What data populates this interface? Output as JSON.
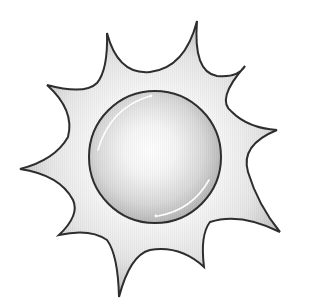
{
  "image": {
    "subject": "sun-illustration",
    "style": "grayscale clip art",
    "colors": {
      "background": "#ffffff",
      "outline": "#2e2e2e",
      "ray_fill_light": "#f7f7f7",
      "ray_fill_dark": "#cfcfcf",
      "disc_center": "#ffffff",
      "disc_edge": "#bdbdbd",
      "highlight": "#ffffff"
    },
    "sun": {
      "ray_count": 10,
      "disc": {
        "cx": 155,
        "cy": 157,
        "r": 66
      }
    }
  }
}
